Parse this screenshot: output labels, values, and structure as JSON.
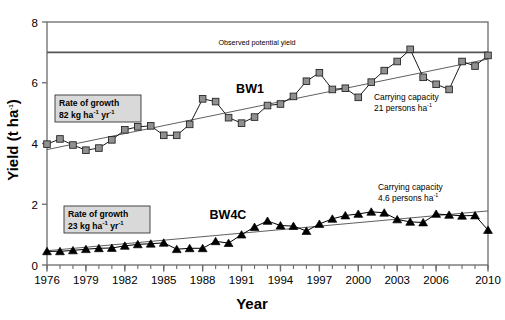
{
  "chart_data": {
    "type": "line",
    "title": "",
    "xlabel": "Year",
    "ylabel": "Yield (t ha-1)",
    "ylabel_display": "Yield (t ha",
    "ylabel_sup": "-1",
    "ylabel_tail": ")",
    "xlim": [
      1976,
      2010
    ],
    "ylim": [
      0,
      8
    ],
    "yticks": [
      "0",
      "2",
      "4",
      "6",
      "8"
    ],
    "ytick_values": [
      0,
      2,
      4,
      6,
      8
    ],
    "xticks": [
      "1976",
      "1979",
      "1982",
      "1985",
      "1988",
      "1991",
      "1994",
      "1997",
      "2000",
      "2003",
      "2006",
      "2010"
    ],
    "xtick_values": [
      1976,
      1979,
      1982,
      1985,
      1988,
      1991,
      1994,
      1997,
      2000,
      2003,
      2006,
      2010
    ],
    "xtick_minor_step": 1,
    "grid": false,
    "legend": "inline-labels",
    "x": [
      1976,
      1977,
      1978,
      1979,
      1980,
      1981,
      1982,
      1983,
      1984,
      1985,
      1986,
      1987,
      1988,
      1989,
      1990,
      1991,
      1992,
      1993,
      1994,
      1995,
      1996,
      1997,
      1998,
      1999,
      2000,
      2001,
      2002,
      2003,
      2004,
      2005,
      2006,
      2007,
      2008,
      2009,
      2010
    ],
    "series": [
      {
        "name": "BW1",
        "marker": "square",
        "marker_color": "#909090",
        "line_color": "#1a1a1a",
        "values": [
          3.98,
          4.15,
          3.95,
          3.78,
          3.85,
          4.12,
          4.45,
          4.55,
          4.58,
          4.27,
          4.27,
          4.63,
          5.47,
          5.38,
          4.85,
          4.67,
          4.87,
          5.25,
          5.3,
          5.55,
          6.05,
          6.33,
          5.78,
          5.82,
          5.52,
          6.02,
          6.4,
          6.7,
          7.1,
          6.18,
          5.95,
          5.78,
          6.7,
          6.55,
          6.9
        ]
      },
      {
        "name": "BW4C",
        "marker": "triangle",
        "marker_color": "#000000",
        "line_color": "#000000",
        "values": [
          0.45,
          0.45,
          0.48,
          0.52,
          0.55,
          0.56,
          0.63,
          0.68,
          0.7,
          0.73,
          0.52,
          0.55,
          0.55,
          0.78,
          0.72,
          1.0,
          1.25,
          1.45,
          1.3,
          1.28,
          1.12,
          1.35,
          1.52,
          1.63,
          1.68,
          1.75,
          1.72,
          1.5,
          1.42,
          1.4,
          1.68,
          1.65,
          1.62,
          1.63,
          1.15
        ]
      }
    ],
    "trendlines": [
      {
        "name": "BW1-trend",
        "x0": 1976,
        "y0": 3.8,
        "x1": 2010,
        "y1": 6.78,
        "slope_kg_ha_yr": 82
      },
      {
        "name": "BW4C-trend",
        "x0": 1976,
        "y0": 0.47,
        "x1": 2010,
        "y1": 1.78,
        "slope_kg_ha_yr": 23
      }
    ],
    "reference_line": {
      "name": "observed-potential-yield",
      "y": 7.0,
      "label": "Observed potential yield"
    },
    "annotations": [
      {
        "id": "rate-bw1",
        "line1": "Rate of growth",
        "line2_pre": "82 kg ha",
        "line2_sup1": "-1",
        "line2_mid": " yr",
        "line2_sup2": "-1",
        "boxed": true
      },
      {
        "id": "rate-bw4c",
        "line1": "Rate of growth",
        "line2_pre": "23 kg ha",
        "line2_sup1": "-1",
        "line2_mid": " yr",
        "line2_sup2": "-1",
        "boxed": true
      },
      {
        "id": "capacity-bw1",
        "line1": "Carrying capacity",
        "line2_pre": "21 persons ha",
        "line2_sup1": "-1",
        "boxed": false
      },
      {
        "id": "capacity-bw4c",
        "line1": "Carrying capacity",
        "line2_pre": "4.6 persons ha",
        "line2_sup1": "-1",
        "boxed": false
      }
    ]
  },
  "labels": {
    "xaxis_title": "Year",
    "series_bw1": "BW1",
    "series_bw4c": "BW4C",
    "potential_yield": "Observed potential yield",
    "rate_growth": "Rate of growth",
    "rate_bw1_value": "82 kg ha",
    "rate_bw4c_value": "23 kg ha",
    "unit_yr": " yr",
    "sup_minus1": "-1",
    "carrying_capacity": "Carrying capacity",
    "capacity_bw1_value": "21 persons ha",
    "capacity_bw4c_value": "4.6 persons ha",
    "ylabel_main": "Yield (t ha",
    "ylabel_close": ")"
  },
  "colors": {
    "frame": "#6b6b6b",
    "bw1_marker": "#8c8c8c",
    "bw1_marker_edge": "#262626",
    "bw4c_marker": "#000000",
    "reference_line": "#555555",
    "trend_line": "#4d4d4d",
    "box_fill": "#d9d9d9",
    "box_border": "#333333",
    "background": "#ffffff"
  }
}
